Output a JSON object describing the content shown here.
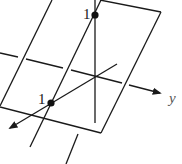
{
  "diagram": {
    "type": "3d-coordinate-plane-sketch",
    "axes": {
      "y": {
        "label": "y"
      },
      "x": {
        "label": ""
      },
      "z": {
        "label": ""
      }
    },
    "points": [
      {
        "name": "point-on-vertical-axis",
        "label": "1"
      },
      {
        "name": "point-on-x-axis",
        "label": "1"
      }
    ],
    "colors": {
      "stroke": "#1a1a1a",
      "axis_label": "#555555",
      "background": "#ffffff"
    }
  }
}
